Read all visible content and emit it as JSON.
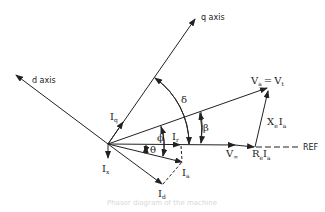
{
  "diagram": {
    "type": "phasor diagram",
    "axes": {
      "q_axis": "q axis",
      "d_axis": "d axis",
      "reference": "REF"
    },
    "phasors": {
      "terminal_voltage": {
        "main": "V",
        "sub": "a",
        "eq": "=",
        "main2": "V",
        "sub2": "t"
      },
      "infinite_bus_voltage": {
        "main": "V",
        "sub": "∞"
      },
      "reactive_drop": {
        "main": "X",
        "sub": "e",
        "main2": "I",
        "sub2": "a"
      },
      "resistive_drop": {
        "main": "R",
        "sub": "e",
        "main2": "I",
        "sub2": "a"
      },
      "armature_current": {
        "main": "I",
        "sub": "a"
      },
      "d_current": {
        "main": "I",
        "sub": "d"
      },
      "q_current": {
        "main": "I",
        "sub": "q"
      },
      "real_current": {
        "main": "I",
        "sub": "r"
      },
      "reactive_current": {
        "main": "I",
        "sub": "x"
      }
    },
    "angles": {
      "delta": "δ",
      "beta": "β",
      "phi": "ϕ",
      "theta": "θ"
    },
    "caption": "Phasor diagram of the machine"
  }
}
